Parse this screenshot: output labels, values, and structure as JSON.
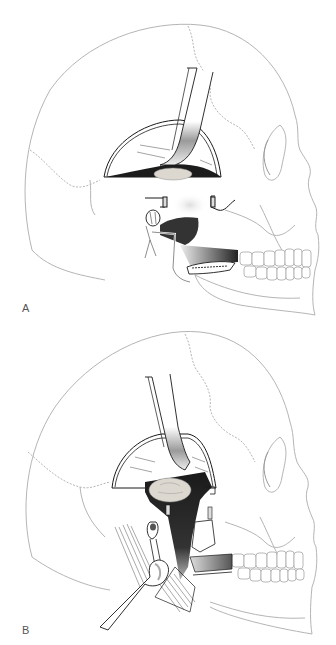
{
  "figure": {
    "panels": [
      {
        "id": "A",
        "label": "A",
        "description": "Lateral skull view: semicircular craniotomy flap with brain retractor, tumor at skull base, exposed temporomandibular region with nerve and vessels, mandible osteotomy"
      },
      {
        "id": "B",
        "label": "B",
        "description": "Lateral skull view: extended exposure with retractor, tumor visible through dark cavity, vessel and neck muscles retracted with a hand-held retractor"
      }
    ],
    "colors": {
      "background": "#ffffff",
      "skull_line": "#b8b8b8",
      "ink": "#1a1a1a",
      "cavity": "#1c1c1c",
      "tumor": "#d8d4cc",
      "label": "#555555"
    }
  }
}
